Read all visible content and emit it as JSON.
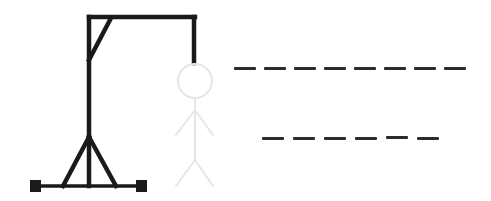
{
  "game": {
    "type": "hangman",
    "colors": {
      "gallows": "#1a1a1a",
      "figure_hidden": "#e6e6e6",
      "blank": "#2b2b2b",
      "background": "#ffffff"
    },
    "figure": {
      "parts": [
        "head",
        "body",
        "left-arm",
        "right-arm",
        "left-leg",
        "right-leg"
      ],
      "revealed_count": 0
    },
    "word": {
      "rows": [
        {
          "length": 8,
          "letters": [
            "",
            "",
            "",
            "",
            "",
            "",
            "",
            ""
          ]
        },
        {
          "length": 6,
          "letters": [
            "",
            "",
            "",
            "",
            "",
            ""
          ]
        }
      ]
    }
  }
}
